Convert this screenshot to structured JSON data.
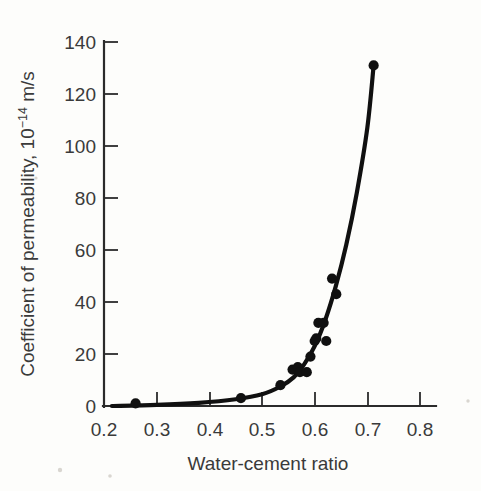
{
  "figure": {
    "background_color": "#fdfdfb",
    "ink_color": "#101010",
    "text_color": "#3a3a3a"
  },
  "axes": {
    "y": {
      "title_main": "Coefficient of permeability, 10",
      "title_exponent": "−14",
      "title_tail": " m/s",
      "title_full": "Coefficient of permeability, 10⁻¹⁴ m/s",
      "ticks": [
        "0",
        "20",
        "40",
        "60",
        "80",
        "100",
        "120",
        "140"
      ],
      "tick_values": [
        0,
        20,
        40,
        60,
        80,
        100,
        120,
        140
      ],
      "min": 0,
      "max": 140
    },
    "x": {
      "title": "Water-cement ratio",
      "ticks": [
        "0.2",
        "0.3",
        "0.4",
        "0.5",
        "0.6",
        "0.7",
        "0.8"
      ],
      "tick_values": [
        0.2,
        0.3,
        0.4,
        0.5,
        0.6,
        0.7,
        0.8
      ],
      "min": 0.2,
      "max": 0.8
    }
  },
  "chart_data": {
    "type": "scatter",
    "title": "",
    "xlabel": "Water-cement ratio",
    "ylabel": "Coefficient of permeability, 10⁻¹⁴ m/s",
    "xlim": [
      0.2,
      0.8
    ],
    "ylim": [
      0,
      140
    ],
    "grid": false,
    "legend": "none",
    "series": [
      {
        "name": "Measured permeability",
        "marker": "filled-circle",
        "color": "#101010",
        "points": [
          {
            "x": 0.26,
            "y": 1
          },
          {
            "x": 0.46,
            "y": 3
          },
          {
            "x": 0.535,
            "y": 8
          },
          {
            "x": 0.558,
            "y": 14
          },
          {
            "x": 0.568,
            "y": 15
          },
          {
            "x": 0.572,
            "y": 13
          },
          {
            "x": 0.585,
            "y": 13
          },
          {
            "x": 0.592,
            "y": 19
          },
          {
            "x": 0.6,
            "y": 25
          },
          {
            "x": 0.603,
            "y": 26
          },
          {
            "x": 0.607,
            "y": 32
          },
          {
            "x": 0.617,
            "y": 32
          },
          {
            "x": 0.622,
            "y": 25
          },
          {
            "x": 0.633,
            "y": 49
          },
          {
            "x": 0.641,
            "y": 43
          },
          {
            "x": 0.712,
            "y": 131
          }
        ]
      }
    ],
    "fit_curve": {
      "name": "Fitted trend line",
      "color": "#101010",
      "points": [
        {
          "x": 0.215,
          "y": 0
        },
        {
          "x": 0.3,
          "y": 0.4
        },
        {
          "x": 0.38,
          "y": 1.2
        },
        {
          "x": 0.45,
          "y": 2.6
        },
        {
          "x": 0.5,
          "y": 4.5
        },
        {
          "x": 0.535,
          "y": 7.5
        },
        {
          "x": 0.56,
          "y": 11
        },
        {
          "x": 0.58,
          "y": 16
        },
        {
          "x": 0.6,
          "y": 23
        },
        {
          "x": 0.62,
          "y": 33
        },
        {
          "x": 0.64,
          "y": 46
        },
        {
          "x": 0.66,
          "y": 62
        },
        {
          "x": 0.68,
          "y": 82
        },
        {
          "x": 0.7,
          "y": 107
        },
        {
          "x": 0.712,
          "y": 131
        }
      ]
    }
  }
}
